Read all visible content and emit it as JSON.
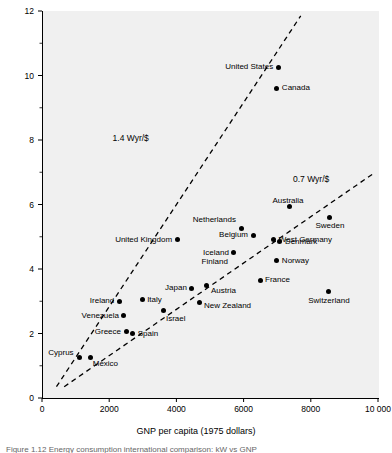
{
  "chart_data": {
    "type": "scatter",
    "title": "",
    "xlabel": "GNP per capita (1975 dollars)",
    "ylabel": "kW per capita",
    "xlim": [
      0,
      10000
    ],
    "ylim": [
      0,
      12
    ],
    "xticks": [
      "0",
      "2000",
      "4000",
      "6000",
      "8000",
      "10 000"
    ],
    "xtick_values": [
      0,
      2000,
      4000,
      6000,
      8000,
      10000
    ],
    "yticks": [
      "0",
      "2",
      "4",
      "6",
      "8",
      "10",
      "12"
    ],
    "ytick_values": [
      0,
      2,
      4,
      6,
      8,
      10,
      12
    ],
    "minor_ticks": true,
    "grid": false,
    "legend": "none",
    "points": [
      {
        "name": "United States",
        "x": 7030,
        "y": 10.25,
        "side": "r"
      },
      {
        "name": "Canada",
        "x": 6990,
        "y": 9.6,
        "side": "l"
      },
      {
        "name": "Australia",
        "x": 7380,
        "y": 5.95,
        "side": "t"
      },
      {
        "name": "Sweden",
        "x": 8570,
        "y": 5.6,
        "side": "b"
      },
      {
        "name": "Netherlands",
        "x": 5950,
        "y": 5.25,
        "side": "t"
      },
      {
        "name": "Belgium",
        "x": 6280,
        "y": 5.05,
        "side": "r"
      },
      {
        "name": "West Germany",
        "x": 6900,
        "y": 4.9,
        "side": "l"
      },
      {
        "name": "Denmark",
        "x": 7080,
        "y": 4.85,
        "side": "l"
      },
      {
        "name": "United Kingdom",
        "x": 4020,
        "y": 4.9,
        "side": "r"
      },
      {
        "name": "Iceland",
        "x": 5710,
        "y": 4.5,
        "side": "r"
      },
      {
        "name": "Finland",
        "x": 5710,
        "y": 4.5,
        "side": "r2"
      },
      {
        "name": "Norway",
        "x": 6990,
        "y": 4.25,
        "side": "l"
      },
      {
        "name": "France",
        "x": 6490,
        "y": 3.65,
        "side": "l"
      },
      {
        "name": "Japan",
        "x": 4460,
        "y": 3.4,
        "side": "r"
      },
      {
        "name": "Austria",
        "x": 4910,
        "y": 3.5,
        "side": "b"
      },
      {
        "name": "Switzerland",
        "x": 8540,
        "y": 3.3,
        "side": "b"
      },
      {
        "name": "Italy",
        "x": 2980,
        "y": 3.05,
        "side": "l"
      },
      {
        "name": "Ireland",
        "x": 2300,
        "y": 3.0,
        "side": "r"
      },
      {
        "name": "New Zealand",
        "x": 4700,
        "y": 2.95,
        "side": "l"
      },
      {
        "name": "Venezuela",
        "x": 2440,
        "y": 2.55,
        "side": "r"
      },
      {
        "name": "Israel",
        "x": 3630,
        "y": 2.7,
        "side": "b"
      },
      {
        "name": "Greece",
        "x": 2500,
        "y": 2.05,
        "side": "r"
      },
      {
        "name": "Spain",
        "x": 2700,
        "y": 2.0,
        "side": "l"
      },
      {
        "name": "Cyprus",
        "x": 1120,
        "y": 1.25,
        "side": "t"
      },
      {
        "name": "Mexico",
        "x": 1450,
        "y": 1.25,
        "side": "b"
      }
    ],
    "trend_lines": [
      {
        "label": "1.4 Wyr/$",
        "slope_label": "1.4",
        "unit": "Wyr/$",
        "x0": 430,
        "y0": 0.35,
        "x1": 7700,
        "y1": 11.85,
        "style": "dashed",
        "label_x": 3180,
        "label_y": 8.05
      },
      {
        "label": "0.7 Wyr/$",
        "slope_label": "0.7",
        "unit": "Wyr/$",
        "x0": 660,
        "y0": 0.35,
        "x1": 9850,
        "y1": 6.95,
        "style": "dashed",
        "label_x": 8550,
        "label_y": 6.8
      }
    ]
  },
  "caption": {
    "text": "Figure 1.12   Energy consumption international comparison: kW vs GNP"
  }
}
